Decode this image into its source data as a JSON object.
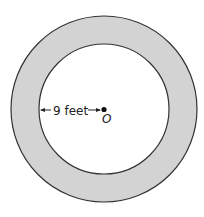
{
  "diagram": {
    "type": "annulus",
    "outer_circle": {
      "fill": "#d3d3d3",
      "stroke": "#333333"
    },
    "inner_circle": {
      "fill": "#ffffff",
      "stroke": "#333333"
    },
    "radius_label": "9 feet",
    "center_label": "O",
    "annotation": "Inner radius of 9 feet measured from center O to inner circle"
  }
}
